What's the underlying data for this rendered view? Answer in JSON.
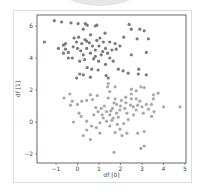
{
  "chart_data": {
    "type": "scatter",
    "title": "",
    "xlabel": "df [0]",
    "ylabel": "df [1]",
    "xlim": [
      -1.9,
      5.0
    ],
    "ylim": [
      -2.6,
      6.7
    ],
    "xticks": [
      -1,
      0,
      1,
      2,
      3,
      4,
      5
    ],
    "yticks": [
      6,
      4,
      2,
      0,
      -2
    ],
    "grid": false,
    "legend": null,
    "series": [
      {
        "name": "cluster-upper",
        "color": "#7a7a7a",
        "points": [
          [
            -1.08,
            6.33
          ],
          [
            -0.74,
            6.25
          ],
          [
            -1.54,
            5.0
          ],
          [
            -0.3,
            6.2
          ],
          [
            0.03,
            6.15
          ],
          [
            0.36,
            6.15
          ],
          [
            0.45,
            6.05
          ],
          [
            0.83,
            6.0
          ],
          [
            0.9,
            6.05
          ],
          [
            0.27,
            5.8
          ],
          [
            -0.56,
            4.9
          ],
          [
            -0.65,
            4.8
          ],
          [
            -0.89,
            4.6
          ],
          [
            -0.56,
            4.55
          ],
          [
            -0.65,
            4.3
          ],
          [
            -0.43,
            4.35
          ],
          [
            -0.24,
            4.0
          ],
          [
            -0.43,
            4.0
          ],
          [
            -0.04,
            5.0
          ],
          [
            -0.16,
            5.25
          ],
          [
            0.05,
            5.3
          ],
          [
            0.2,
            4.9
          ],
          [
            0.43,
            5.05
          ],
          [
            0.61,
            5.45
          ],
          [
            0.9,
            5.1
          ],
          [
            1.04,
            5.25
          ],
          [
            1.28,
            5.55
          ],
          [
            1.5,
            5.0
          ],
          [
            1.75,
            4.9
          ],
          [
            1.8,
            4.55
          ],
          [
            1.97,
            4.75
          ],
          [
            2.15,
            5.3
          ],
          [
            2.4,
            6.1
          ],
          [
            2.5,
            5.8
          ],
          [
            2.9,
            5.8
          ],
          [
            3.1,
            5.7
          ],
          [
            2.77,
            5.2
          ],
          [
            3.3,
            5.2
          ],
          [
            3.2,
            4.35
          ],
          [
            2.5,
            4.2
          ],
          [
            0.43,
            4.6
          ],
          [
            0.6,
            4.3
          ],
          [
            0.27,
            4.2
          ],
          [
            0.1,
            3.8
          ],
          [
            0.33,
            3.9
          ],
          [
            0.83,
            4.1
          ],
          [
            0.98,
            3.8
          ],
          [
            1.3,
            3.6
          ],
          [
            1.5,
            4.0
          ],
          [
            1.66,
            3.8
          ],
          [
            1.17,
            4.4
          ],
          [
            1.3,
            4.6
          ],
          [
            1.0,
            4.75
          ],
          [
            0.83,
            4.5
          ],
          [
            0.7,
            4.75
          ],
          [
            0.45,
            3.4
          ],
          [
            0.66,
            3.3
          ],
          [
            0.96,
            3.25
          ],
          [
            0.1,
            3.0
          ],
          [
            -0.04,
            2.75
          ],
          [
            0.27,
            2.95
          ],
          [
            0.6,
            2.8
          ],
          [
            1.9,
            3.3
          ],
          [
            2.12,
            3.2
          ],
          [
            2.36,
            3.05
          ],
          [
            1.43,
            2.75
          ],
          [
            1.33,
            2.9
          ],
          [
            2.85,
            3.3
          ],
          [
            3.2,
            2.95
          ],
          [
            2.83,
            3.0
          ],
          [
            0.15,
            4.45
          ],
          [
            0.55,
            4.95
          ],
          [
            1.1,
            4.2
          ],
          [
            1.2,
            5.0
          ],
          [
            0.0,
            4.6
          ],
          [
            -0.2,
            4.7
          ],
          [
            0.75,
            3.95
          ],
          [
            1.4,
            4.3
          ],
          [
            1.6,
            4.5
          ],
          [
            0.35,
            5.15
          ]
        ]
      },
      {
        "name": "cluster-lower",
        "color": "#a9a9a9",
        "points": [
          [
            -0.63,
            1.5
          ],
          [
            -0.36,
            1.75
          ],
          [
            -0.24,
            1.3
          ],
          [
            -0.32,
            1.05
          ],
          [
            0.0,
            1.1
          ],
          [
            0.2,
            1.3
          ],
          [
            0.43,
            1.35
          ],
          [
            0.7,
            1.4
          ],
          [
            0.6,
            1.7
          ],
          [
            0.92,
            1.65
          ],
          [
            0.07,
            0.55
          ],
          [
            0.17,
            0.35
          ],
          [
            -0.19,
            0.0
          ],
          [
            0.43,
            0.05
          ],
          [
            0.76,
            0.45
          ],
          [
            0.96,
            0.65
          ],
          [
            1.1,
            0.85
          ],
          [
            1.35,
            0.65
          ],
          [
            1.63,
            0.85
          ],
          [
            1.82,
            1.1
          ],
          [
            2.04,
            1.35
          ],
          [
            2.24,
            1.55
          ],
          [
            2.5,
            1.45
          ],
          [
            2.6,
            0.95
          ],
          [
            2.8,
            1.05
          ],
          [
            3.0,
            0.95
          ],
          [
            3.2,
            1.1
          ],
          [
            3.44,
            1.1
          ],
          [
            3.53,
            1.45
          ],
          [
            3.75,
            1.8
          ],
          [
            4.0,
            0.95
          ],
          [
            4.77,
            0.95
          ],
          [
            3.56,
            0.65
          ],
          [
            3.44,
            0.35
          ],
          [
            3.06,
            0.55
          ],
          [
            2.73,
            0.75
          ],
          [
            2.6,
            0.45
          ],
          [
            2.36,
            0.15
          ],
          [
            2.15,
            -0.1
          ],
          [
            1.97,
            -0.45
          ],
          [
            1.75,
            -0.65
          ],
          [
            1.5,
            -0.25
          ],
          [
            1.35,
            0.05
          ],
          [
            1.2,
            0.25
          ],
          [
            1.04,
            -0.05
          ],
          [
            0.88,
            -0.35
          ],
          [
            0.65,
            -0.25
          ],
          [
            0.43,
            -0.5
          ],
          [
            0.27,
            -0.85
          ],
          [
            0.6,
            -1.1
          ],
          [
            1.04,
            -0.7
          ],
          [
            1.7,
            -1.9
          ],
          [
            2.8,
            -0.7
          ],
          [
            3.1,
            -0.6
          ],
          [
            2.95,
            -1.65
          ],
          [
            3.1,
            -1.5
          ],
          [
            2.3,
            -0.7
          ],
          [
            2.07,
            -0.85
          ],
          [
            1.66,
            0.25
          ],
          [
            1.82,
            0.55
          ],
          [
            1.97,
            0.75
          ],
          [
            1.5,
            0.45
          ],
          [
            1.75,
            1.45
          ],
          [
            1.43,
            1.5
          ],
          [
            1.5,
            1.9
          ],
          [
            1.75,
            2.2
          ],
          [
            1.4,
            2.2
          ],
          [
            1.43,
            2.4
          ],
          [
            2.5,
            2.05
          ],
          [
            2.73,
            1.95
          ],
          [
            2.95,
            2.2
          ],
          [
            3.1,
            2.15
          ],
          [
            3.53,
            1.7
          ],
          [
            2.5,
            1.75
          ],
          [
            2.73,
            1.45
          ],
          [
            2.2,
            0.85
          ],
          [
            2.47,
            1.05
          ],
          [
            1.6,
            0.1
          ],
          [
            1.9,
            0.3
          ],
          [
            2.3,
            0.55
          ],
          [
            1.25,
            1.0
          ],
          [
            1.55,
            0.7
          ],
          [
            2.0,
            1.0
          ],
          [
            1.85,
            -0.15
          ],
          [
            2.25,
            1.2
          ],
          [
            1.15,
            0.45
          ],
          [
            0.85,
            0.9
          ],
          [
            2.9,
            1.3
          ],
          [
            3.3,
            0.8
          ],
          [
            1.7,
            1.2
          ]
        ]
      }
    ]
  }
}
